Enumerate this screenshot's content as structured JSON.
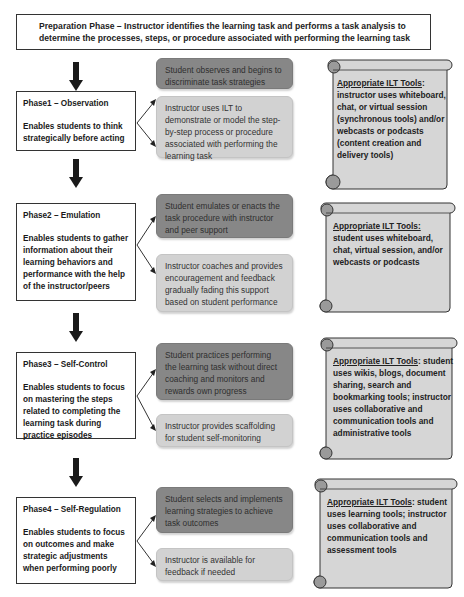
{
  "preparation": {
    "text": "Preparation Phase – Instructor identifies the learning task and performs a task analysis to determine the processes, steps, or procedure associated with performing the learning task"
  },
  "phases": [
    {
      "title": "Phase1 – Observation",
      "description": "Enables students to think strategically before acting",
      "student_activity": "Student observes and begins to discriminate task strategies",
      "instructor_activity": "Instructor uses ILT to demonstrate or model the step-by-step process or procedure associated with performing the learning task",
      "tools_heading": "Appropriate ILT Tools",
      "tools_text": "instructor uses whiteboard, chat, or virtual session (synchronous tools) and/or webcasts or podcasts (content creation and delivery tools)"
    },
    {
      "title": "Phase2 – Emulation",
      "description": "Enables students to gather information about their learning behaviors and performance with the help of the instructor/peers",
      "student_activity": "Student emulates or enacts the task procedure with instructor and peer support",
      "instructor_activity": "Instructor coaches and provides encouragement and feedback gradually fading this support based on student performance",
      "tools_heading": "Appropriate ILT Tools:",
      "tools_text": "student uses whiteboard, chat, virtual session, and/or webcasts or podcasts"
    },
    {
      "title": "Phase3 – Self-Control",
      "description": "Enables students to focus on mastering the steps related to completing the learning task during practice episodes",
      "student_activity": "Student practices performing the learning task without direct coaching and monitors and rewards own progress",
      "instructor_activity": "Instructor provides scaffolding for student self-monitoring",
      "tools_heading": "Appropriate ILT Tools",
      "tools_text": "student uses wikis, blogs, document sharing, search and bookmarking tools; instructor uses collaborative and communication tools and administrative tools"
    },
    {
      "title": "Phase4 – Self-Regulation",
      "description": "Enables students to focus on outcomes and make strategic adjustments when performing poorly",
      "student_activity": "Student selects and implements learning strategies to achieve task outcomes",
      "instructor_activity": "Instructor is available for feedback if needed",
      "tools_heading": "Appropriate ILT Tools",
      "tools_text": "student uses learning tools; instructor uses collaborative and communication tools and assessment tools"
    }
  ],
  "colors": {
    "student_box": "#878787",
    "instructor_box": "#d2d2d2",
    "scroll_fill": "#d6d6d6",
    "arrow": "#1a1a1a"
  }
}
